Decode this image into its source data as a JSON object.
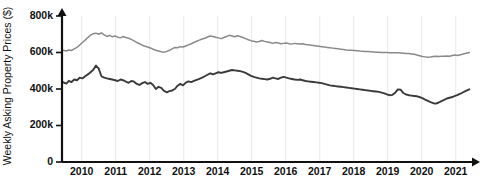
{
  "chart_data": {
    "type": "line",
    "title": "",
    "xlabel": "",
    "ylabel": "Weekly Asking Property Prices ($)",
    "xlim": [
      2009.42,
      2021.42
    ],
    "ylim": [
      0,
      800000
    ],
    "grid": true,
    "legend_position": "none",
    "x_tick_labels": [
      "2010",
      "2011",
      "2012",
      "2013",
      "2014",
      "2015",
      "2016",
      "2017",
      "2018",
      "2019",
      "2020",
      "2021"
    ],
    "x_ticks": [
      2010,
      2011,
      2012,
      2013,
      2014,
      2015,
      2016,
      2017,
      2018,
      2019,
      2020,
      2021
    ],
    "y_tick_labels": [
      "0",
      "200k",
      "400k",
      "600k",
      "800k"
    ],
    "y_ticks": [
      0,
      200000,
      400000,
      600000,
      800000
    ],
    "series": [
      {
        "name": "upper-series",
        "color": "#8a8a8a",
        "x": [
          2009.45,
          2009.55,
          2009.62,
          2009.7,
          2009.78,
          2009.86,
          2009.94,
          2010.02,
          2010.1,
          2010.18,
          2010.26,
          2010.34,
          2010.42,
          2010.5,
          2010.58,
          2010.66,
          2010.74,
          2010.82,
          2010.9,
          2010.98,
          2011.06,
          2011.14,
          2011.22,
          2011.3,
          2011.38,
          2011.46,
          2011.54,
          2011.62,
          2011.7,
          2011.78,
          2011.86,
          2011.94,
          2012.02,
          2012.1,
          2012.18,
          2012.26,
          2012.34,
          2012.42,
          2012.5,
          2012.58,
          2012.66,
          2012.74,
          2012.82,
          2012.9,
          2012.98,
          2013.06,
          2013.14,
          2013.22,
          2013.3,
          2013.38,
          2013.46,
          2013.54,
          2013.62,
          2013.7,
          2013.78,
          2013.86,
          2013.94,
          2014.02,
          2014.1,
          2014.18,
          2014.26,
          2014.34,
          2014.42,
          2014.5,
          2014.58,
          2014.66,
          2014.74,
          2014.82,
          2014.9,
          2014.98,
          2015.06,
          2015.14,
          2015.22,
          2015.3,
          2015.38,
          2015.46,
          2015.54,
          2015.62,
          2015.7,
          2015.78,
          2015.86,
          2015.94,
          2016.02,
          2016.1,
          2016.18,
          2016.26,
          2016.34,
          2016.42,
          2016.5,
          2016.58,
          2016.66,
          2016.74,
          2016.82,
          2016.9,
          2016.98,
          2017.06,
          2017.14,
          2017.22,
          2017.3,
          2017.38,
          2017.46,
          2017.54,
          2017.62,
          2017.7,
          2017.78,
          2017.86,
          2017.94,
          2018.02,
          2018.1,
          2018.18,
          2018.26,
          2018.34,
          2018.42,
          2018.5,
          2018.58,
          2018.66,
          2018.74,
          2018.82,
          2018.9,
          2018.98,
          2019.06,
          2019.14,
          2019.22,
          2019.3,
          2019.38,
          2019.46,
          2019.54,
          2019.62,
          2019.7,
          2019.78,
          2019.86,
          2019.94,
          2020.02,
          2020.1,
          2020.18,
          2020.26,
          2020.34,
          2020.42,
          2020.5,
          2020.58,
          2020.66,
          2020.74,
          2020.82,
          2020.9,
          2020.98,
          2021.06,
          2021.14,
          2021.22,
          2021.3,
          2021.4
        ],
        "values": [
          612000,
          608000,
          614000,
          611000,
          620000,
          628000,
          641000,
          655000,
          668000,
          682000,
          695000,
          703000,
          706000,
          700000,
          708000,
          697000,
          688000,
          694000,
          686000,
          690000,
          684000,
          680000,
          688000,
          682000,
          678000,
          672000,
          664000,
          655000,
          648000,
          640000,
          634000,
          630000,
          625000,
          618000,
          612000,
          608000,
          604000,
          602000,
          606000,
          612000,
          620000,
          628000,
          626000,
          632000,
          630000,
          636000,
          642000,
          648000,
          655000,
          662000,
          668000,
          674000,
          678000,
          685000,
          690000,
          688000,
          684000,
          680000,
          676000,
          682000,
          688000,
          694000,
          690000,
          686000,
          692000,
          688000,
          682000,
          676000,
          670000,
          665000,
          662000,
          658000,
          660000,
          666000,
          661000,
          658000,
          655000,
          650000,
          655000,
          652000,
          648000,
          650000,
          652000,
          648000,
          646000,
          650000,
          648000,
          646000,
          648000,
          644000,
          642000,
          640000,
          638000,
          636000,
          634000,
          632000,
          630000,
          628000,
          626000,
          624000,
          622000,
          620000,
          618000,
          616000,
          614000,
          613000,
          612000,
          611000,
          610000,
          608000,
          607000,
          606000,
          605000,
          604000,
          603000,
          602000,
          601000,
          600000,
          600000,
          600000,
          599000,
          599000,
          598000,
          598000,
          597000,
          596000,
          595000,
          594000,
          592000,
          590000,
          586000,
          582000,
          578000,
          576000,
          574000,
          575000,
          578000,
          580000,
          578000,
          580000,
          579000,
          581000,
          580000,
          583000,
          586000,
          584000,
          588000,
          592000,
          596000,
          600000
        ]
      },
      {
        "name": "lower-series",
        "color": "#3a3a3a",
        "x": [
          2009.45,
          2009.55,
          2009.62,
          2009.7,
          2009.78,
          2009.86,
          2009.94,
          2010.02,
          2010.1,
          2010.18,
          2010.26,
          2010.34,
          2010.42,
          2010.5,
          2010.58,
          2010.66,
          2010.74,
          2010.82,
          2010.9,
          2010.98,
          2011.06,
          2011.14,
          2011.22,
          2011.3,
          2011.38,
          2011.46,
          2011.54,
          2011.62,
          2011.7,
          2011.78,
          2011.86,
          2011.94,
          2012.02,
          2012.1,
          2012.18,
          2012.26,
          2012.34,
          2012.42,
          2012.5,
          2012.58,
          2012.66,
          2012.74,
          2012.82,
          2012.9,
          2012.98,
          2013.06,
          2013.14,
          2013.22,
          2013.3,
          2013.38,
          2013.46,
          2013.54,
          2013.62,
          2013.7,
          2013.78,
          2013.86,
          2013.94,
          2014.02,
          2014.1,
          2014.18,
          2014.26,
          2014.34,
          2014.42,
          2014.5,
          2014.58,
          2014.66,
          2014.74,
          2014.82,
          2014.9,
          2014.98,
          2015.06,
          2015.14,
          2015.22,
          2015.3,
          2015.38,
          2015.46,
          2015.54,
          2015.62,
          2015.7,
          2015.78,
          2015.86,
          2015.94,
          2016.02,
          2016.1,
          2016.18,
          2016.26,
          2016.34,
          2016.42,
          2016.5,
          2016.58,
          2016.66,
          2016.74,
          2016.82,
          2016.9,
          2016.98,
          2017.06,
          2017.14,
          2017.22,
          2017.3,
          2017.38,
          2017.46,
          2017.54,
          2017.62,
          2017.7,
          2017.78,
          2017.86,
          2017.94,
          2018.02,
          2018.1,
          2018.18,
          2018.26,
          2018.34,
          2018.42,
          2018.5,
          2018.58,
          2018.66,
          2018.74,
          2018.82,
          2018.9,
          2018.98,
          2019.06,
          2019.14,
          2019.22,
          2019.3,
          2019.38,
          2019.46,
          2019.54,
          2019.62,
          2019.7,
          2019.78,
          2019.86,
          2019.94,
          2020.02,
          2020.1,
          2020.18,
          2020.26,
          2020.34,
          2020.42,
          2020.5,
          2020.58,
          2020.66,
          2020.74,
          2020.82,
          2020.9,
          2020.98,
          2021.06,
          2021.14,
          2021.22,
          2021.3,
          2021.4
        ],
        "values": [
          437000,
          430000,
          445000,
          438000,
          452000,
          448000,
          462000,
          458000,
          470000,
          480000,
          492000,
          505000,
          528000,
          512000,
          470000,
          462000,
          458000,
          455000,
          452000,
          448000,
          444000,
          452000,
          448000,
          440000,
          434000,
          444000,
          440000,
          428000,
          422000,
          432000,
          438000,
          428000,
          434000,
          422000,
          400000,
          412000,
          406000,
          390000,
          382000,
          388000,
          392000,
          400000,
          418000,
          428000,
          420000,
          435000,
          442000,
          438000,
          444000,
          450000,
          456000,
          462000,
          470000,
          478000,
          486000,
          480000,
          486000,
          492000,
          488000,
          492000,
          496000,
          500000,
          504000,
          502000,
          500000,
          498000,
          494000,
          488000,
          480000,
          472000,
          466000,
          462000,
          458000,
          456000,
          454000,
          452000,
          456000,
          462000,
          458000,
          455000,
          462000,
          466000,
          462000,
          458000,
          455000,
          452000,
          450000,
          452000,
          448000,
          444000,
          442000,
          440000,
          438000,
          436000,
          434000,
          432000,
          428000,
          424000,
          420000,
          418000,
          416000,
          414000,
          412000,
          410000,
          408000,
          406000,
          404000,
          402000,
          400000,
          398000,
          396000,
          394000,
          392000,
          390000,
          388000,
          386000,
          384000,
          380000,
          376000,
          370000,
          366000,
          368000,
          380000,
          398000,
          396000,
          378000,
          370000,
          366000,
          364000,
          362000,
          360000,
          356000,
          350000,
          342000,
          335000,
          328000,
          322000,
          320000,
          326000,
          334000,
          340000,
          348000,
          352000,
          356000,
          362000,
          368000,
          374000,
          382000,
          390000,
          398000
        ]
      }
    ]
  },
  "axes": {
    "y_axis_title": "Weekly Asking Property Prices ($)"
  }
}
